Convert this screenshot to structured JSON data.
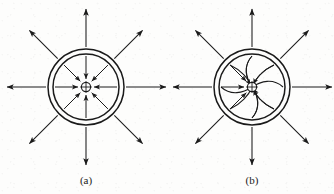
{
  "figure": {
    "background_color": "#fdfdfc",
    "stroke_color": "#1a1a1a",
    "width": 334,
    "height": 194
  },
  "panels": [
    {
      "id": "panel-a",
      "caption": "(a)",
      "caption_x": 86,
      "caption_y": 184,
      "description": "radial straight vanes",
      "center_x": 86,
      "center_y": 87,
      "outer_ring_radius": 38,
      "inner_ring_radius": 33,
      "hub_radius": 5,
      "hub_marker": "cross",
      "vane_type": "straight",
      "vane_count": 8,
      "vane_direction": "inward",
      "vane_inner_radius": 8,
      "vane_outer_radius": 31,
      "external_arrow_count": 8,
      "external_arrow_direction": "outward",
      "external_arrow_start_radius": 40,
      "external_arrow_end_radius": 80,
      "angles_deg": [
        0,
        45,
        90,
        135,
        180,
        225,
        270,
        315
      ]
    },
    {
      "id": "panel-b",
      "caption": "(b)",
      "caption_x": 252,
      "caption_y": 184,
      "description": "backward-curved spiral vanes",
      "center_x": 252,
      "center_y": 87,
      "outer_ring_radius": 38,
      "inner_ring_radius": 33,
      "hub_radius": 5,
      "hub_marker": "cross",
      "vane_type": "curved",
      "vane_count": 8,
      "vane_direction": "inward",
      "vane_inner_radius": 8,
      "vane_outer_radius": 31,
      "curved_vane_count": 4,
      "curve_sweep_deg": 62,
      "external_arrow_count": 8,
      "external_arrow_direction": "outward",
      "external_arrow_start_radius": 40,
      "external_arrow_end_radius": 80,
      "angles_deg": [
        0,
        45,
        90,
        135,
        180,
        225,
        270,
        315
      ]
    }
  ],
  "labels": {
    "caption_a": "(a)",
    "caption_b": "(b)"
  }
}
